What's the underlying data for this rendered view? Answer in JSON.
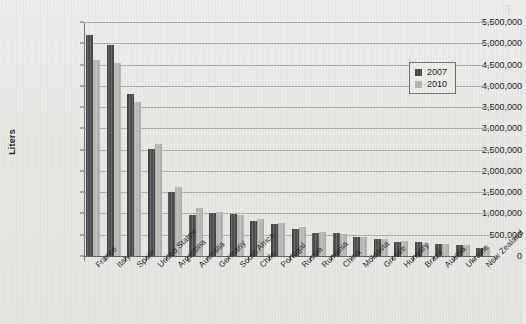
{
  "chart_data": {
    "type": "bar",
    "title": "",
    "xlabel": "",
    "ylabel": "Liters",
    "ylim": [
      0,
      5500000
    ],
    "ytick_step": 500000,
    "grid": true,
    "legend_position": "top-right",
    "categories": [
      "France",
      "Italy",
      "Spain",
      "United States",
      "Argentina",
      "Australia",
      "Germany",
      "South Africa",
      "Chile",
      "Portugal",
      "Russia",
      "Rumania",
      "China",
      "Moldavia",
      "Greece",
      "Hungary",
      "Brazil",
      "Austria",
      "Ukraine",
      "New Zealand"
    ],
    "ytick_labels": [
      "0",
      "500,000",
      "1,000,000",
      "1,500,000",
      "2,000,000",
      "2,500,000",
      "3,000,000",
      "3,500,000",
      "4,000,000",
      "4,500,000",
      "5,000,000",
      "5,500,000"
    ],
    "series": [
      {
        "name": "2007",
        "color": "#454545",
        "values": [
          5200000,
          4950000,
          3810000,
          2520000,
          1500000,
          960000,
          1000000,
          980000,
          830000,
          750000,
          640000,
          530000,
          550000,
          440000,
          390000,
          340000,
          320000,
          280000,
          260000,
          190000
        ]
      },
      {
        "name": "2010",
        "color": "#b0b0ad",
        "values": [
          4600000,
          4540000,
          3610000,
          2630000,
          1620000,
          1130000,
          1030000,
          970000,
          880000,
          780000,
          680000,
          560000,
          520000,
          440000,
          410000,
          360000,
          310000,
          290000,
          260000,
          210000
        ]
      }
    ]
  },
  "legend": {
    "items": [
      {
        "label": "2007"
      },
      {
        "label": "2010"
      }
    ]
  }
}
